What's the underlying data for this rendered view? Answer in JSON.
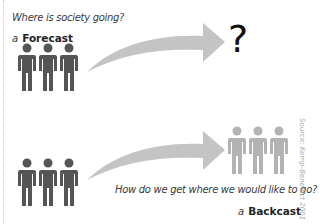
{
  "forecast": {
    "question": "Where is society going?",
    "article": "a",
    "label": "Forecast",
    "outcome_symbol": "?",
    "people_color": "#555555"
  },
  "backcast": {
    "question": "How do we get where we would like to go?",
    "article": "a",
    "label": "Backcast",
    "people_color_start": "#555555",
    "people_color_end": "#b3b3b3"
  },
  "arrow_color": "#c4c4c4",
  "source": "Source: Kemp-Benedict 2001"
}
